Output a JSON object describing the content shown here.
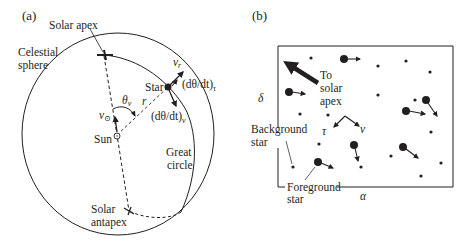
{
  "figure": {
    "ink_color": "#231f20",
    "background": "#ffffff"
  },
  "panel_a": {
    "label": "(a)",
    "labels": {
      "solar_apex": "Solar apex",
      "celestial_line1": "Celestial",
      "celestial_line2": "sphere",
      "star": "Star",
      "v_r": "v",
      "v_r_sub": "r",
      "dtheta_tau": "(dθ/dt)",
      "dtheta_tau_sub": "τ",
      "dtheta_v": "(dθ/dt)",
      "dtheta_v_sub": "v",
      "theta_v": "θ",
      "theta_v_sub": "v",
      "r": "r",
      "v_sun": "v",
      "v_sun_sub": "⊙",
      "sun": "Sun",
      "great_line1": "Great",
      "great_line2": "circle",
      "antapex_line1": "Solar",
      "antapex_line2": "antapex"
    }
  },
  "panel_b": {
    "label": "(b)",
    "labels": {
      "delta": "δ",
      "alpha": "α",
      "to_line1": "To",
      "to_line2": "solar",
      "to_line3": "apex",
      "tau": "τ",
      "v": "v",
      "background_line1": "Background",
      "background_line2": "star",
      "foreground_line1": "Foreground",
      "foreground_line2": "star"
    },
    "background_stars": [
      [
        311,
        58
      ],
      [
        378,
        66
      ],
      [
        406,
        61
      ],
      [
        430,
        72
      ],
      [
        378,
        95
      ],
      [
        415,
        100
      ],
      [
        300,
        114
      ],
      [
        328,
        115
      ],
      [
        431,
        132
      ],
      [
        319,
        144
      ],
      [
        391,
        156
      ],
      [
        441,
        163
      ],
      [
        293,
        167
      ],
      [
        361,
        167
      ],
      [
        421,
        176
      ]
    ],
    "foreground_stars": [
      {
        "x": 344,
        "y": 59,
        "dx": 16,
        "dy": 0
      },
      {
        "x": 289,
        "y": 92,
        "dx": 16,
        "dy": 2
      },
      {
        "x": 406,
        "y": 111,
        "dx": 19,
        "dy": 3
      },
      {
        "x": 426,
        "y": 100,
        "dx": 11,
        "dy": 16
      },
      {
        "x": 354,
        "y": 145,
        "dx": 4,
        "dy": 16
      },
      {
        "x": 403,
        "y": 147,
        "dx": 15,
        "dy": 11
      },
      {
        "x": 318,
        "y": 162,
        "dx": 15,
        "dy": 6
      }
    ]
  }
}
